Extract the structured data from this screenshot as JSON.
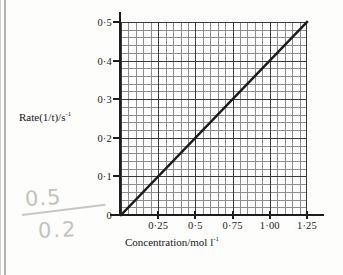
{
  "chart_data": {
    "type": "line",
    "title": "",
    "xlabel": "Concentration/mol l⁻¹",
    "ylabel": "Rate(1/t)/s⁻¹",
    "xlabel_parts": {
      "base": "Concentration/mol l",
      "exponent": "-1"
    },
    "ylabel_parts": {
      "base": "Rate(1/t)/s",
      "exponent": "-1"
    },
    "xlim": [
      0,
      1.25
    ],
    "ylim": [
      0,
      0.5
    ],
    "x_major_ticks": [
      0.25,
      0.5,
      0.75,
      1.0,
      1.25
    ],
    "x_tick_labels": [
      "0·25",
      "0·5",
      "0·75",
      "1·00",
      "1·25"
    ],
    "y_major_ticks": [
      0,
      0.1,
      0.2,
      0.3,
      0.4,
      0.5
    ],
    "y_tick_labels": [
      "0",
      "0·1",
      "0·2",
      "0·3",
      "0·4",
      "0·5"
    ],
    "grid": "graph-paper",
    "minor_cells_x": 25,
    "minor_cells_y": 25,
    "minor_per_major": 5,
    "legend": "none",
    "series": [
      {
        "name": "Rate vs Concentration",
        "type": "line",
        "x": [
          0,
          1.25
        ],
        "y": [
          0,
          0.5
        ],
        "slope": 0.4,
        "intercept": 0,
        "color": "#1a1a1a"
      }
    ],
    "annotations": [
      {
        "name": "pencil-gradient-calculation",
        "numerator": "0.5",
        "denominator": "0.2",
        "color": "#c2c3c0"
      }
    ]
  }
}
